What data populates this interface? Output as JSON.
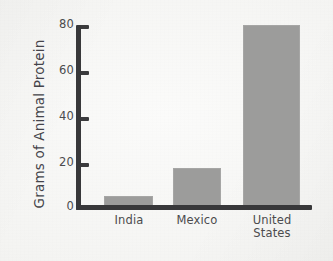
{
  "chart_data": {
    "type": "bar",
    "title": "",
    "subtitle": "",
    "xlabel": "",
    "ylabel": "Grams of Animal Protein",
    "categories": [
      "India",
      "Mexico",
      "United States"
    ],
    "category_lines": [
      [
        "India"
      ],
      [
        "Mexico"
      ],
      [
        "United",
        "States"
      ]
    ],
    "values": [
      5.5,
      18,
      80
    ],
    "ylim": [
      0,
      80
    ],
    "ytick_labels": [
      "0",
      "20",
      "40",
      "60",
      "80"
    ],
    "ytick_values": [
      0,
      20,
      40,
      60,
      80
    ],
    "grid": false,
    "legend": null,
    "bar_color": "#9c9c9b",
    "axis_color": "#38383a",
    "text_color": "#4b4b4d",
    "background_color": "#f6f6f4"
  }
}
